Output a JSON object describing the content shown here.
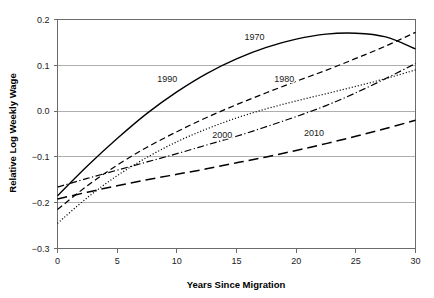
{
  "chart_data": {
    "type": "line",
    "title": "",
    "xlabel": "Years Since Migration",
    "ylabel": "Relative Log Weekly Wage",
    "xlim": [
      0,
      30
    ],
    "ylim": [
      -0.3,
      0.2
    ],
    "xticks": [
      "0",
      "5",
      "10",
      "15",
      "20",
      "25",
      "30"
    ],
    "xtick_values": [
      0,
      5,
      10,
      15,
      20,
      25,
      30
    ],
    "yticks": [
      "0.2",
      "0.1",
      "0.0",
      "-0.1",
      "-0.2",
      "-0.3"
    ],
    "ytick_values": [
      0.2,
      0.1,
      0.0,
      -0.1,
      -0.2,
      -0.3
    ],
    "grid": "horizontal",
    "legend_position": "inline-annotations",
    "x": [
      0,
      2.5,
      5,
      7.5,
      10,
      12.5,
      15,
      17.5,
      20,
      22.5,
      25,
      27.5,
      30
    ],
    "series": [
      {
        "name": "1970",
        "linestyle": "solid",
        "label": "1970",
        "label_x": 16.5,
        "label_y": 0.163,
        "values": [
          -0.185,
          -0.12,
          -0.06,
          -0.005,
          0.042,
          0.082,
          0.114,
          0.139,
          0.157,
          0.168,
          0.17,
          0.162,
          0.136
        ]
      },
      {
        "name": "1990",
        "linestyle": "dashed",
        "label": "1990",
        "label_x": 9.2,
        "label_y": 0.07,
        "values": [
          -0.215,
          -0.163,
          -0.118,
          -0.079,
          -0.045,
          -0.014,
          0.014,
          0.04,
          0.065,
          0.089,
          0.115,
          0.142,
          0.172
        ]
      },
      {
        "name": "1980",
        "linestyle": "dotted",
        "label": "1980",
        "label_x": 19.0,
        "label_y": 0.07,
        "values": [
          -0.245,
          -0.189,
          -0.141,
          -0.101,
          -0.067,
          -0.039,
          -0.015,
          0.005,
          0.022,
          0.038,
          0.054,
          0.071,
          0.09
        ]
      },
      {
        "name": "2000",
        "linestyle": "dashdot",
        "label": "2000",
        "label_x": 13.8,
        "label_y": -0.052,
        "values": [
          -0.166,
          -0.147,
          -0.129,
          -0.111,
          -0.093,
          -0.074,
          -0.055,
          -0.034,
          -0.012,
          0.012,
          0.04,
          0.071,
          0.104
        ]
      },
      {
        "name": "2010",
        "linestyle": "longdash",
        "label": "2010",
        "label_x": 21.5,
        "label_y": -0.047,
        "values": [
          -0.192,
          -0.177,
          -0.163,
          -0.15,
          -0.138,
          -0.126,
          -0.113,
          -0.1,
          -0.086,
          -0.071,
          -0.055,
          -0.038,
          -0.02
        ]
      }
    ]
  }
}
